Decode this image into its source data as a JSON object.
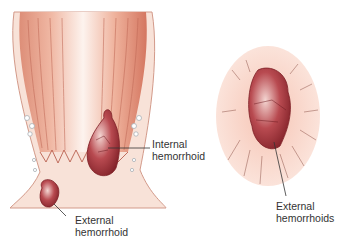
{
  "diagram": {
    "labels": {
      "internal": [
        "Internal",
        "hemorrhoid"
      ],
      "external_left": [
        "External",
        "hemorrhoid"
      ],
      "external_right": [
        "External",
        "hemorrhoids"
      ]
    },
    "colors": {
      "tissue_light": "#f7d9cc",
      "tissue_mid": "#e9a890",
      "tissue_dark": "#d77e68",
      "hemorrhoid": "#a8333a",
      "hemorrhoid_dark": "#7e1f26",
      "leader": "#333333"
    }
  }
}
